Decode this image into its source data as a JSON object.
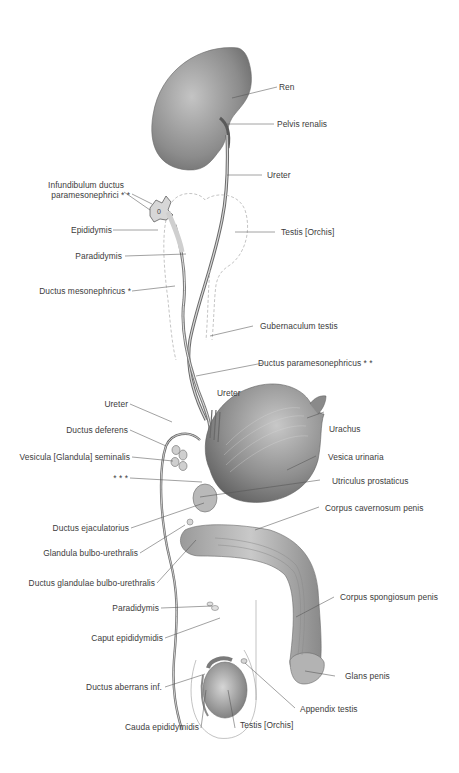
{
  "figure": {
    "type": "anatomical-illustration",
    "colors": {
      "background": "#ffffff",
      "label_text": "#3c3c3c",
      "leader_line": "#555555",
      "organ_dark": "#6e6e6e",
      "organ_mid": "#a8a8a8",
      "organ_light": "#e2e2e2",
      "dashed_outline": "#bdbdbd"
    }
  },
  "labels": {
    "ren": "Ren",
    "pelvis_renalis": "Pelvis renalis",
    "ureter_top": "Ureter",
    "infundibulum_1": "Infundibulum ductus",
    "infundibulum_2": "paramesonephrici * *",
    "epididymis": "Epididymis",
    "testis_top": "Testis [Orchis]",
    "paradidymis_top": "Paradidymis",
    "ductus_mesonephricus": "Ductus mesonephricus *",
    "gubernaculum": "Gubernaculum testis",
    "ductus_paramesonephricus": "Ductus paramesonephricus * *",
    "ureter_mid": "Ureter",
    "ureter_left": "Ureter",
    "urachus": "Urachus",
    "ductus_deferens": "Ductus deferens",
    "vesica_urinaria": "Vesica urinaria",
    "vesicula_seminalis": "Vesicula  [Glandula] seminalis",
    "triple_star": "* * *",
    "utriculus_prostaticus": "Utriculus prostaticus",
    "corpus_cavernosum": "Corpus cavernosum penis",
    "ductus_ejaculatorius": "Ductus ejaculatorius",
    "glandula_bulbo": "Glandula bulbo-urethralis",
    "ductus_glandulae_bulbo": "Ductus glandulae bulbo-urethralis",
    "paradidymis_bottom": "Paradidymis",
    "corpus_spongiosum": "Corpus spongiosum penis",
    "caput_epididymidis": "Caput epididymidis",
    "glans_penis": "Glans penis",
    "ductus_aberrans": "Ductus aberrans inf.",
    "appendix_testis": "Appendix testis",
    "cauda_epididymidis": "Cauda epididymidis",
    "testis_bottom": "Testis [Orchis]"
  }
}
